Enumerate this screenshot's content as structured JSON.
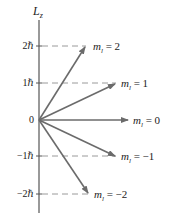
{
  "diagram": {
    "axis_label": "L",
    "axis_subscript": "z",
    "ticks": [
      {
        "label": "2ℏ",
        "value": 2
      },
      {
        "label": "1ℏ",
        "value": 1
      },
      {
        "label": "0",
        "value": 0
      },
      {
        "label": "−1ℏ",
        "value": -1
      },
      {
        "label": "−2ℏ",
        "value": -2
      }
    ],
    "vectors": [
      {
        "label_m": "m",
        "label_sub": "l",
        "label_eq": " = 2",
        "ml": 2
      },
      {
        "label_m": "m",
        "label_sub": "l",
        "label_eq": " = 1",
        "ml": 1
      },
      {
        "label_m": "m",
        "label_sub": "l",
        "label_eq": " = 0",
        "ml": 0
      },
      {
        "label_m": "m",
        "label_sub": "l",
        "label_eq": " = −1",
        "ml": -1
      },
      {
        "label_m": "m",
        "label_sub": "l",
        "label_eq": " = −2",
        "ml": -2
      }
    ],
    "colors": {
      "axis": "#555555",
      "arrow": "#6b6b6b",
      "dashed": "#9a9a9a",
      "text": "#222222"
    }
  }
}
